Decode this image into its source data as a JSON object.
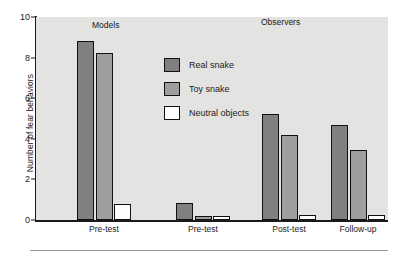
{
  "chart_data": {
    "type": "bar",
    "title": "",
    "xlabel": "",
    "ylabel": "Number of fear behaviors",
    "ylim": [
      0,
      10
    ],
    "yticks": [
      0,
      2,
      4,
      6,
      8,
      10
    ],
    "ytick_labels": [
      "0",
      "2",
      "4",
      "6",
      "8",
      "10"
    ],
    "grid": false,
    "categories": [
      "Pre-test",
      "Pre-test",
      "Post-test",
      "Follow-up"
    ],
    "series": [
      {
        "name": "Real snake",
        "color": "#808080",
        "values": [
          8.8,
          0.85,
          5.2,
          4.7
        ]
      },
      {
        "name": "Toy snake",
        "color": "#9e9e9e",
        "values": [
          8.25,
          0.2,
          4.2,
          3.45
        ]
      },
      {
        "name": "Neutral objects",
        "color": "#fdfdfb",
        "values": [
          0.8,
          0.22,
          0.25,
          0.25
        ]
      }
    ],
    "legend_position": "upper-center",
    "annotations": [
      {
        "text": "Models",
        "x_category_index": 0
      },
      {
        "text": "Observers",
        "x_category_index": 2
      }
    ],
    "plot_background": "#e3e3e1",
    "axis_color": "#1a1a1a"
  },
  "legend": {
    "items": [
      {
        "label": "Real snake"
      },
      {
        "label": "Toy snake"
      },
      {
        "label": "Neutral objects"
      }
    ]
  },
  "sections": {
    "models_label": "Models",
    "observers_label": "Observers"
  }
}
